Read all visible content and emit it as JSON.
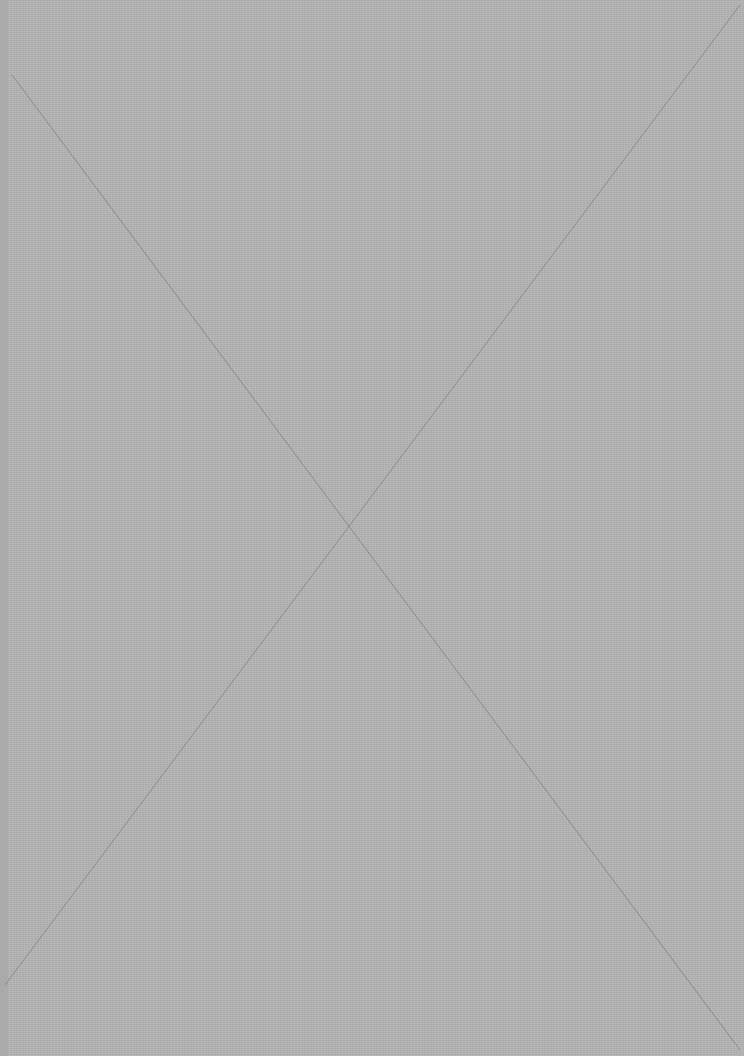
{
  "image": {
    "type": "image-placeholder",
    "description": "gray placeholder with diagonal cross",
    "colors": {
      "fill": "#b5b5b5",
      "left_strip": "#aaaaaa",
      "cross_line": "#8a8a8a",
      "margin": "#ffffff"
    },
    "cross_lines": [
      {
        "x1": 12,
        "y1": 75,
        "x2": 740,
        "y2": 1050
      },
      {
        "x1": 740,
        "y1": 5,
        "x2": 5,
        "y2": 985
      }
    ]
  }
}
